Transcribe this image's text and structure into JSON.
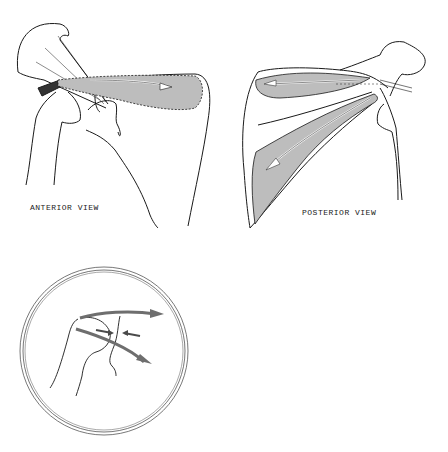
{
  "figure": {
    "panels": [
      {
        "id": "anterior",
        "label": "ANTERIOR VIEW"
      },
      {
        "id": "posterior",
        "label": "POSTERIOR VIEW"
      },
      {
        "id": "inset",
        "label": ""
      }
    ]
  },
  "colors": {
    "line": "#1a1a1a",
    "muscle_fill": "#bdbdbd",
    "inset_arrow": "#6e6e6e",
    "background": "#ffffff"
  }
}
